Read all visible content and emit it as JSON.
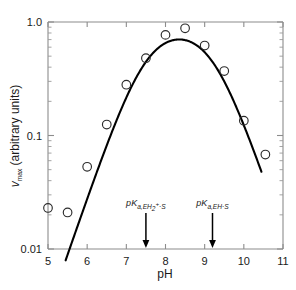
{
  "chart_data": {
    "type": "scatter",
    "title": "",
    "xlabel": "pH",
    "ylabel": "v_max (arbitrary units)",
    "ylabel_parts": {
      "symbol": "v",
      "subscript": "max",
      "units": "(arbitrary units)"
    },
    "xlim": [
      5,
      11
    ],
    "ylim": [
      0.01,
      1.0
    ],
    "yscale": "log",
    "xscale": "linear",
    "grid": false,
    "legend": null,
    "x_ticks": [
      5,
      6,
      7,
      8,
      9,
      10,
      11
    ],
    "x_tick_labels": [
      "5",
      "6",
      "7",
      "8",
      "9",
      "10",
      "11"
    ],
    "y_ticks": [
      0.01,
      0.1,
      1.0
    ],
    "y_tick_labels": [
      "0.01",
      "0.1",
      "1.0"
    ],
    "y_minor_ticks": [
      0.02,
      0.03,
      0.04,
      0.05,
      0.06,
      0.07,
      0.08,
      0.09,
      0.2,
      0.3,
      0.4,
      0.5,
      0.6,
      0.7,
      0.8,
      0.9
    ],
    "series": [
      {
        "name": "vmax data",
        "marker": "open-circle",
        "x": [
          5.0,
          5.5,
          6.0,
          6.5,
          7.0,
          7.5,
          8.0,
          8.5,
          9.0,
          9.5,
          10.0,
          10.55
        ],
        "y": [
          0.023,
          0.021,
          0.053,
          0.125,
          0.28,
          0.48,
          0.77,
          0.88,
          0.62,
          0.37,
          0.135,
          0.068
        ]
      }
    ],
    "fit_curve": {
      "name": "bell-shaped pH-rate fit",
      "description": "Theoretical curve for a diprotic enzyme-substrate complex",
      "pka_low": 7.5,
      "pka_high": 9.2,
      "max_value": 0.9,
      "x_start": 5.45,
      "x_end": 10.45
    },
    "annotations": [
      {
        "name": "pKa-EH2-S",
        "label_plain": "pKa,EH2+·S",
        "prefix": "p",
        "italic_k": "K",
        "sub_main": "a,EH",
        "sub_num": "2",
        "sub_sup": "+",
        "sub_tail": "·S",
        "x": 7.5,
        "arrow": true
      },
      {
        "name": "pKa-EH-S",
        "label_plain": "pKa,EH·S",
        "prefix": "p",
        "italic_k": "K",
        "sub_main": "a,EH",
        "sub_num": "",
        "sub_sup": "",
        "sub_tail": "·S",
        "x": 9.2,
        "arrow": true
      }
    ],
    "colors": {
      "curve": "#000000",
      "marker": "#2b2b2b",
      "axis": "#8c8c8c",
      "text": "#1a1a1a",
      "background": "#ffffff"
    }
  }
}
